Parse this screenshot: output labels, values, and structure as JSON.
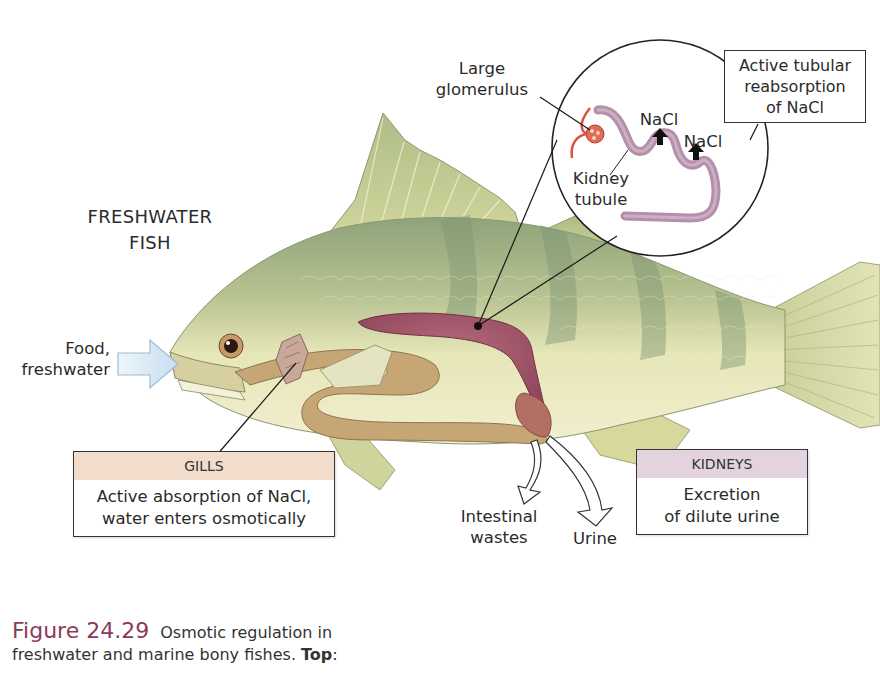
{
  "diagram": {
    "title_line1": "FRESHWATER",
    "title_line2": "FISH",
    "intake_label_line1": "Food,",
    "intake_label_line2": "freshwater",
    "inset": {
      "glomerulus_line1": "Large",
      "glomerulus_line2": "glomerulus",
      "tubule_line1": "Kidney",
      "tubule_line2": "tubule",
      "nacl_1": "NaCl",
      "nacl_2": "NaCl",
      "reabsorption_line1": "Active tubular",
      "reabsorption_line2": "reabsorption",
      "reabsorption_line3": "of NaCl"
    },
    "gills_box": {
      "heading": "GILLS",
      "line1": "Active absorption of NaCl,",
      "line2": "water enters osmotically",
      "heading_color": "#f2dccb"
    },
    "kidneys_box": {
      "heading": "KIDNEYS",
      "line1": "Excretion",
      "line2": "of dilute urine",
      "heading_color": "#e3d3df"
    },
    "outputs": {
      "intestinal_line1": "Intestinal",
      "intestinal_line2": "wastes",
      "urine": "Urine"
    },
    "colors": {
      "fish_body": "#d9dca6",
      "fish_back": "#9fae7c",
      "kidney": "#a4566a",
      "gut": "#c9a874",
      "tubule": "#b88fa8",
      "glomerulus": "#d9533f",
      "arrow_intake": "#dcecf7"
    }
  },
  "caption": {
    "figure_number": "Figure 24.29",
    "text_line1": "Osmotic regulation in",
    "text_line2": "freshwater and marine bony fishes.",
    "bold": "Top",
    "after_bold": ":"
  }
}
